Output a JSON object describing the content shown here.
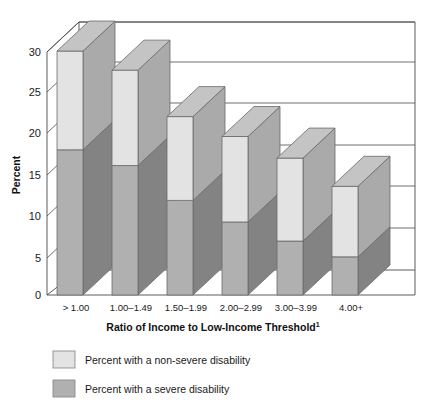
{
  "chart_data": {
    "type": "bar",
    "subtype": "stacked-3d-column",
    "title": "",
    "xlabel": "Ratio of Income to Low-Income Threshold",
    "xlabel_superscript": "1",
    "ylabel": "Percent",
    "categories": [
      "> 1.00",
      "1.00–1.49",
      "1.50–1.99",
      "2.00–2.99",
      "3.00–3.99",
      "4.00+"
    ],
    "series": [
      {
        "name": "Percent with a severe disability",
        "color": "#b0b0b0",
        "side_color": "#838383",
        "top_color": "#9a9a9a",
        "values": [
          17.5,
          15.6,
          11.4,
          8.8,
          6.5,
          4.6
        ]
      },
      {
        "name": "Percent with a non-severe disability",
        "color": "#e3e3e3",
        "side_color": "#aaaaaa",
        "top_color": "#c4c4c4",
        "values": [
          11.9,
          11.5,
          10.1,
          10.3,
          10.0,
          8.5
        ]
      }
    ],
    "totals": [
      29.4,
      27.1,
      21.5,
      19.1,
      16.5,
      13.1
    ],
    "yticks": [
      0,
      5,
      10,
      15,
      20,
      25,
      30
    ],
    "ylim": [
      0,
      32
    ],
    "grid": true,
    "legend_position": "bottom-left",
    "legend": [
      {
        "label": "Percent with a non-severe disability",
        "color": "#e3e3e3"
      },
      {
        "label": "Percent with a severe disability",
        "color": "#b0b0b0"
      }
    ]
  },
  "axis": {
    "y_title": "Percent",
    "x_title": "Ratio of Income to Low-Income Threshold",
    "x_title_sup": "1",
    "ticks": [
      "30",
      "25",
      "20",
      "15",
      "10",
      "5",
      "0"
    ]
  }
}
